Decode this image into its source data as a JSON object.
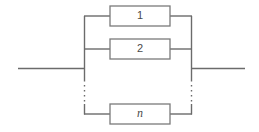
{
  "diagram": {
    "type": "reliability-block-diagram",
    "blocks": [
      {
        "id": "block-1",
        "label": "1",
        "style": "upright",
        "x": 110,
        "y": 6,
        "width": 60,
        "height": 20,
        "connector_y": 16
      },
      {
        "id": "block-2",
        "label": "2",
        "style": "upright",
        "x": 110,
        "y": 39,
        "width": 60,
        "height": 20,
        "connector_y": 49
      },
      {
        "id": "block-n",
        "label": "n",
        "style": "italic",
        "x": 110,
        "y": 104,
        "width": 60,
        "height": 20,
        "connector_y": 114
      }
    ],
    "buses": {
      "left_x": 84,
      "right_x": 192,
      "solid_top_y": 16,
      "solid_bottom_y": 114,
      "dash_start_y": 80,
      "dash_end_y": 104
    },
    "leads": {
      "input_x_start": 18,
      "input_x_end": 84,
      "output_x_start": 192,
      "output_x_end": 245,
      "main_line_y": 68
    },
    "colors": {
      "background": "#ffffff",
      "wire": "#6b6b6b",
      "block_border": "#7a7a7a",
      "label_text": "#4a4a4a"
    }
  }
}
